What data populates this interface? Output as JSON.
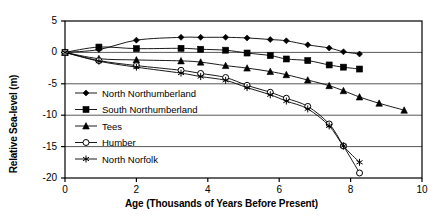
{
  "chart_data": {
    "type": "line",
    "title": "",
    "xlabel": "Age (Thousands of Years Before Present)",
    "ylabel": "Relative Sea-level (m)",
    "xlim": [
      0,
      10
    ],
    "ylim": [
      -20,
      5
    ],
    "xticks": [
      0,
      2,
      4,
      6,
      8,
      10
    ],
    "yticks": [
      5,
      0,
      -5,
      -10,
      -15,
      -20
    ],
    "xtick_labels": [
      "0",
      "2",
      "4",
      "6",
      "8",
      "10"
    ],
    "ytick_labels": [
      "5",
      "0",
      "-5",
      "-10",
      "-15",
      "-20"
    ],
    "grid": "horizontal",
    "legend_position": "inside-lower-left",
    "series": [
      {
        "name": "North Northumberland",
        "marker": "filled-diamond",
        "color": "#000000",
        "points": [
          [
            0.0,
            0.0
          ],
          [
            0.95,
            0.45
          ],
          [
            2.0,
            1.95
          ],
          [
            3.25,
            2.4
          ],
          [
            3.8,
            2.4
          ],
          [
            4.5,
            2.4
          ],
          [
            5.1,
            2.3
          ],
          [
            5.75,
            2.05
          ],
          [
            6.2,
            1.85
          ],
          [
            6.8,
            1.2
          ],
          [
            7.4,
            0.7
          ],
          [
            7.8,
            0.1
          ],
          [
            8.25,
            -0.25
          ]
        ]
      },
      {
        "name": "South Northumberland",
        "marker": "filled-square",
        "color": "#000000",
        "points": [
          [
            0.0,
            0.0
          ],
          [
            0.95,
            0.85
          ],
          [
            2.0,
            0.6
          ],
          [
            3.25,
            0.65
          ],
          [
            3.8,
            0.5
          ],
          [
            4.5,
            0.35
          ],
          [
            5.1,
            -0.1
          ],
          [
            5.75,
            -0.5
          ],
          [
            6.2,
            -1.05
          ],
          [
            6.8,
            -1.3
          ],
          [
            7.4,
            -2.0
          ],
          [
            7.8,
            -2.35
          ],
          [
            8.25,
            -2.65
          ]
        ]
      },
      {
        "name": "Tees",
        "marker": "filled-triangle",
        "color": "#000000",
        "points": [
          [
            0.0,
            0.0
          ],
          [
            0.95,
            -1.0
          ],
          [
            2.0,
            -1.2
          ],
          [
            3.25,
            -1.35
          ],
          [
            3.8,
            -1.55
          ],
          [
            4.5,
            -2.1
          ],
          [
            5.1,
            -2.5
          ],
          [
            5.75,
            -3.05
          ],
          [
            6.2,
            -3.55
          ],
          [
            6.8,
            -4.4
          ],
          [
            7.4,
            -5.3
          ],
          [
            7.8,
            -6.1
          ],
          [
            8.25,
            -7.1
          ],
          [
            8.8,
            -8.1
          ],
          [
            9.5,
            -9.2
          ]
        ]
      },
      {
        "name": "Humber",
        "marker": "open-circle",
        "color": "#000000",
        "points": [
          [
            0.0,
            0.0
          ],
          [
            0.95,
            -1.3
          ],
          [
            2.0,
            -2.1
          ],
          [
            3.25,
            -2.85
          ],
          [
            3.8,
            -3.35
          ],
          [
            4.5,
            -4.0
          ],
          [
            5.1,
            -5.25
          ],
          [
            5.75,
            -6.35
          ],
          [
            6.2,
            -7.3
          ],
          [
            6.8,
            -8.6
          ],
          [
            7.4,
            -11.4
          ],
          [
            7.8,
            -14.9
          ],
          [
            8.25,
            -19.2
          ]
        ]
      },
      {
        "name": "North Norfolk",
        "marker": "asterisk",
        "color": "#000000",
        "points": [
          [
            0.0,
            0.0
          ],
          [
            0.95,
            -1.4
          ],
          [
            2.0,
            -2.35
          ],
          [
            3.25,
            -3.3
          ],
          [
            3.8,
            -3.85
          ],
          [
            4.5,
            -4.45
          ],
          [
            5.1,
            -5.6
          ],
          [
            5.75,
            -6.75
          ],
          [
            6.2,
            -7.75
          ],
          [
            6.8,
            -9.0
          ],
          [
            7.4,
            -11.7
          ],
          [
            7.8,
            -14.9
          ],
          [
            8.25,
            -17.5
          ]
        ]
      }
    ]
  },
  "legend": {
    "items": [
      {
        "label": "North Northumberland",
        "marker": "filled-diamond"
      },
      {
        "label": "South Northumberland",
        "marker": "filled-square"
      },
      {
        "label": "Tees",
        "marker": "filled-triangle"
      },
      {
        "label": "Humber",
        "marker": "open-circle"
      },
      {
        "label": "North Norfolk",
        "marker": "asterisk"
      }
    ]
  }
}
